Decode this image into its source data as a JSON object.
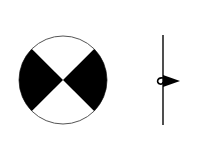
{
  "diagram": {
    "colors": {
      "background": "#ffffff",
      "fill": "#000000",
      "stroke": "#222222",
      "circle_outline": "#555555"
    },
    "circle_symbol": {
      "center": [
        63,
        80
      ],
      "radius": 44,
      "filled_sectors": [
        "left",
        "right"
      ]
    },
    "line_symbol": {
      "x": 163,
      "y_start": 35,
      "y_end": 125,
      "loop_y": 81,
      "arrow_direction": "right"
    }
  }
}
